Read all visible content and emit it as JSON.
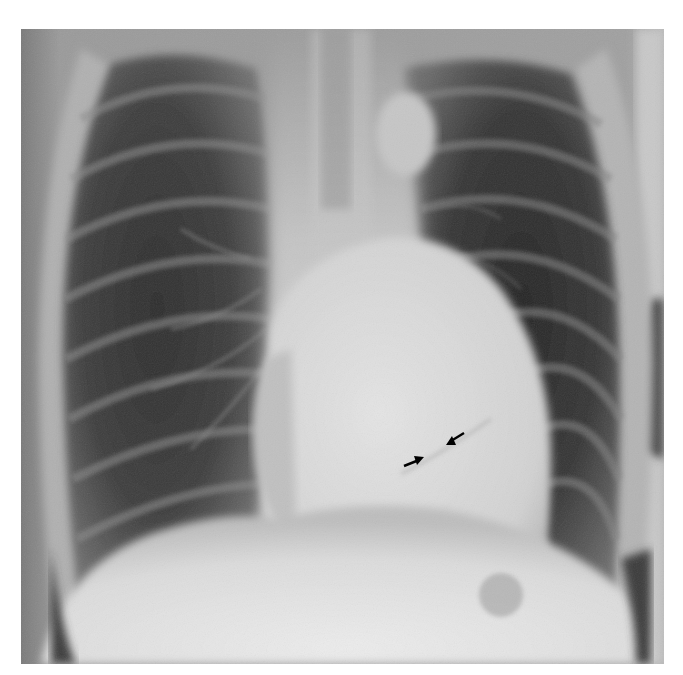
{
  "image": {
    "kind": "chest-radiograph",
    "view": "posteroanterior",
    "description": "Frontal chest X-ray showing lungs, rib cage, mediastinum, enlarged cardiac silhouette, and diaphragm domes; two small black arrows point to a contour within the cardiac shadow.",
    "frame_color": "#ffffff",
    "annotations": [
      {
        "type": "arrow",
        "name": "arrow-lower-left",
        "direction": "pointing-right-up",
        "x": 413,
        "y": 462,
        "color": "#000000"
      },
      {
        "type": "arrow",
        "name": "arrow-upper-right",
        "direction": "pointing-left-down",
        "x": 456,
        "y": 438,
        "color": "#000000"
      }
    ]
  }
}
